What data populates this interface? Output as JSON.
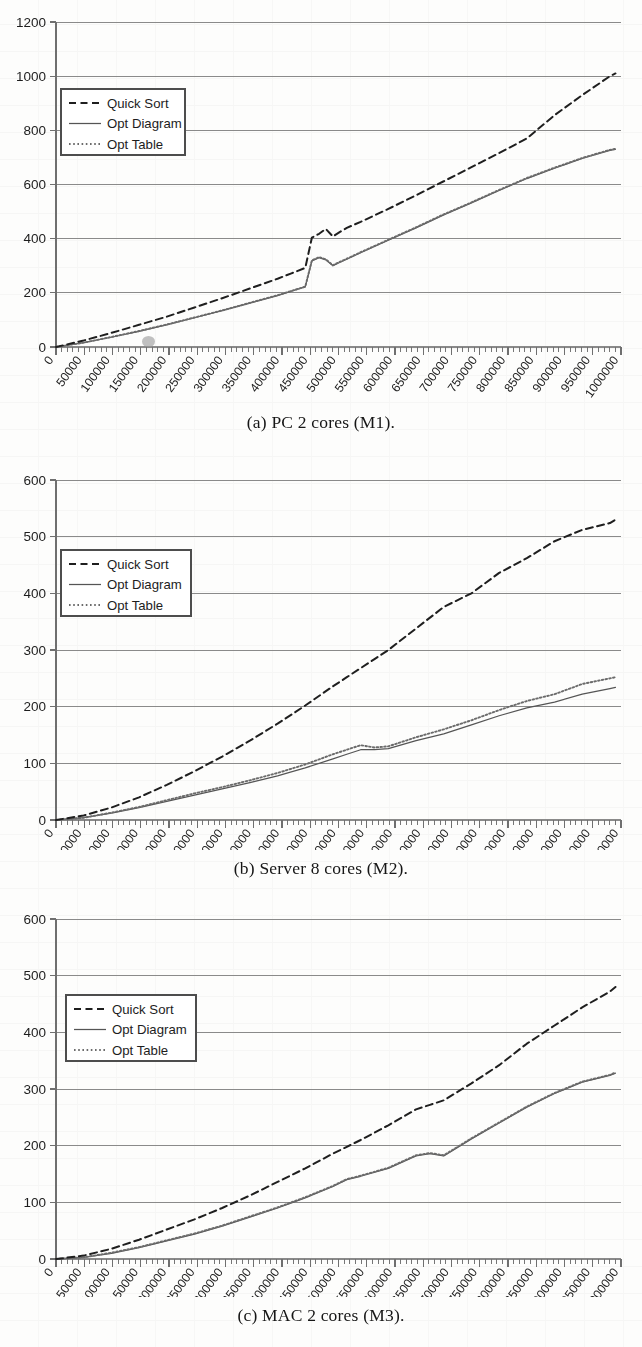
{
  "document": {
    "type": "scanned-paper-figure",
    "figure_count": 3
  },
  "common": {
    "legend": [
      {
        "label": "Quick Sort",
        "style": "dashed"
      },
      {
        "label": "Opt Diagram",
        "style": "solid"
      },
      {
        "label": "Opt Table",
        "style": "dotted"
      }
    ],
    "x_tick_labels": [
      "0",
      "50000",
      "100000",
      "150000",
      "200000",
      "250000",
      "300000",
      "350000",
      "400000",
      "450000",
      "500000",
      "550000",
      "600000",
      "650000",
      "700000",
      "750000",
      "800000",
      "850000",
      "900000",
      "950000",
      "1000000"
    ],
    "colors": {
      "axis": "#6f6f6f",
      "gridline": "#8a8a8a",
      "quick_sort": "#1f1f1f",
      "opt_diagram": "#555555",
      "opt_table": "#6b6b6b",
      "text": "#1d1d1d",
      "background": "#fdfdfc"
    }
  },
  "figures": [
    {
      "id": "a",
      "caption": "(a) PC 2 cores (M1).",
      "y_tick_labels": [
        "0",
        "200",
        "400",
        "600",
        "800",
        "1000",
        "1200"
      ]
    },
    {
      "id": "b",
      "caption": "(b) Server 8 cores (M2).",
      "y_tick_labels": [
        "0",
        "100",
        "200",
        "300",
        "400",
        "500",
        "600"
      ]
    },
    {
      "id": "c",
      "caption": "(c) MAC 2 cores (M3).",
      "y_tick_labels": [
        "0",
        "100",
        "200",
        "300",
        "400",
        "500",
        "600"
      ]
    }
  ],
  "chart_data": [
    {
      "type": "line",
      "id": "a",
      "title": "(a) PC 2 cores (M1).",
      "xlabel": "",
      "ylabel": "",
      "xlim": [
        0,
        1020000
      ],
      "ylim": [
        0,
        1200
      ],
      "ygrid": true,
      "xgrid": false,
      "legend_position": "upper-left-inside",
      "x": [
        0,
        50000,
        100000,
        150000,
        200000,
        250000,
        300000,
        350000,
        400000,
        425000,
        450000,
        462000,
        475000,
        487000,
        500000,
        512000,
        525000,
        550000,
        600000,
        650000,
        700000,
        750000,
        800000,
        850000,
        900000,
        950000,
        1000000,
        1010000
      ],
      "series": [
        {
          "name": "Quick Sort",
          "style": "dashed",
          "values": [
            0,
            24,
            52,
            82,
            112,
            146,
            180,
            216,
            252,
            272,
            292,
            404,
            418,
            436,
            408,
            424,
            440,
            462,
            510,
            560,
            612,
            664,
            716,
            770,
            856,
            930,
            1000,
            1010
          ]
        },
        {
          "name": "Opt Diagram",
          "style": "solid",
          "values": [
            0,
            16,
            36,
            58,
            82,
            108,
            134,
            162,
            190,
            206,
            222,
            318,
            330,
            322,
            300,
            312,
            324,
            348,
            394,
            440,
            488,
            532,
            578,
            622,
            660,
            696,
            726,
            730
          ]
        },
        {
          "name": "Opt Table",
          "style": "dotted",
          "values": [
            0,
            16,
            37,
            59,
            83,
            109,
            135,
            163,
            191,
            207,
            223,
            320,
            332,
            324,
            302,
            314,
            326,
            350,
            396,
            442,
            490,
            534,
            580,
            624,
            662,
            698,
            728,
            732
          ]
        }
      ],
      "annotations": [
        {
          "type": "scan-smudge",
          "x": 185000,
          "y": 30,
          "description": "gray ink blot artifact near x-axis"
        }
      ]
    },
    {
      "type": "line",
      "id": "b",
      "title": "(b) Server 8 cores (M2).",
      "xlabel": "",
      "ylabel": "",
      "xlim": [
        0,
        1020000
      ],
      "ylim": [
        0,
        600
      ],
      "ygrid": true,
      "xgrid": false,
      "legend_position": "upper-left-inside",
      "x": [
        0,
        50000,
        100000,
        150000,
        200000,
        250000,
        300000,
        350000,
        400000,
        450000,
        500000,
        525000,
        550000,
        575000,
        600000,
        650000,
        700000,
        750000,
        800000,
        850000,
        900000,
        950000,
        1000000,
        1010000
      ],
      "series": [
        {
          "name": "Quick Sort",
          "style": "dashed",
          "values": [
            0,
            8,
            22,
            40,
            62,
            86,
            112,
            140,
            170,
            202,
            236,
            252,
            268,
            284,
            300,
            338,
            376,
            400,
            436,
            462,
            492,
            512,
            524,
            530
          ]
        },
        {
          "name": "Opt Diagram",
          "style": "solid",
          "values": [
            0,
            4,
            12,
            22,
            33,
            44,
            55,
            66,
            78,
            92,
            108,
            116,
            124,
            124,
            126,
            140,
            152,
            168,
            184,
            198,
            208,
            222,
            232,
            234
          ]
        },
        {
          "name": "Opt Table",
          "style": "dotted",
          "values": [
            0,
            4,
            13,
            23,
            35,
            47,
            58,
            70,
            83,
            98,
            116,
            124,
            132,
            128,
            130,
            146,
            160,
            176,
            194,
            210,
            222,
            240,
            250,
            252
          ]
        }
      ]
    },
    {
      "type": "line",
      "id": "c",
      "title": "(c) MAC 2 cores (M3).",
      "xlabel": "",
      "ylabel": "",
      "xlim": [
        0,
        1020000
      ],
      "ylim": [
        0,
        600
      ],
      "ygrid": true,
      "xgrid": false,
      "legend_position": "upper-left-inside",
      "x": [
        0,
        50000,
        100000,
        150000,
        200000,
        250000,
        300000,
        350000,
        400000,
        450000,
        500000,
        525000,
        550000,
        600000,
        650000,
        675000,
        700000,
        750000,
        800000,
        850000,
        900000,
        950000,
        1000000,
        1010000
      ],
      "series": [
        {
          "name": "Quick Sort",
          "style": "dashed",
          "values": [
            0,
            6,
            18,
            34,
            52,
            70,
            90,
            112,
            136,
            160,
            186,
            198,
            210,
            236,
            264,
            272,
            280,
            310,
            342,
            380,
            412,
            444,
            472,
            480
          ]
        },
        {
          "name": "Opt Diagram",
          "style": "solid",
          "values": [
            0,
            3,
            10,
            20,
            32,
            44,
            58,
            74,
            90,
            108,
            128,
            140,
            146,
            160,
            182,
            186,
            182,
            212,
            240,
            268,
            292,
            312,
            324,
            328
          ]
        },
        {
          "name": "Opt Table",
          "style": "dotted",
          "values": [
            0,
            3,
            11,
            21,
            33,
            45,
            59,
            75,
            91,
            109,
            129,
            141,
            147,
            161,
            183,
            187,
            183,
            213,
            241,
            269,
            293,
            313,
            325,
            329
          ]
        }
      ]
    }
  ]
}
